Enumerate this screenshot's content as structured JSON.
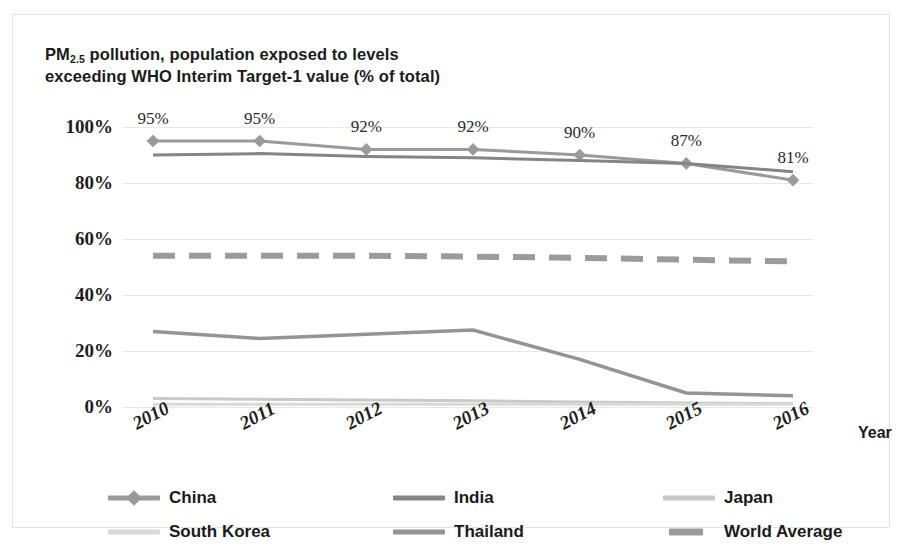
{
  "chart_data": {
    "type": "line",
    "title": "PM2.5 pollution, population exposed to levels exceeding WHO Interim Target-1 value (% of total)",
    "title_line1_pre": "PM",
    "title_line1_sub": "2.5",
    "title_line1_post": " pollution, population exposed to levels",
    "title_line2": "exceeding WHO Interim Target-1 value (% of total)",
    "xlabel": "Year",
    "ylabel": "",
    "categories": [
      "2010",
      "2011",
      "2012",
      "2013",
      "2014",
      "2015",
      "2016"
    ],
    "x": [
      2010,
      2011,
      2012,
      2013,
      2014,
      2015,
      2016
    ],
    "ylim": [
      0,
      100
    ],
    "yticks": [
      "0%",
      "20%",
      "40%",
      "60%",
      "80%",
      "100%"
    ],
    "ytick_values": [
      0,
      20,
      40,
      60,
      80,
      100
    ],
    "grid": true,
    "legend_position": "bottom",
    "data_labels": [
      "95%",
      "95%",
      "92%",
      "92%",
      "90%",
      "87%",
      "81%"
    ],
    "data_label_series": "China",
    "series": [
      {
        "name": "China",
        "color": "#9a9a9a",
        "marker": "diamond",
        "dashed": false,
        "width": 3,
        "values": [
          95,
          95,
          92,
          92,
          90,
          87,
          81
        ]
      },
      {
        "name": "India",
        "color": "#858585",
        "marker": "none",
        "dashed": false,
        "width": 3,
        "values": [
          90,
          90.5,
          89.5,
          89,
          88,
          87,
          84
        ]
      },
      {
        "name": "Japan",
        "color": "#c9c9c9",
        "marker": "none",
        "dashed": false,
        "width": 3,
        "values": [
          3,
          2.8,
          2.5,
          2.2,
          1.8,
          1.4,
          1.2
        ]
      },
      {
        "name": "South Korea",
        "color": "#d9d9d9",
        "marker": "none",
        "dashed": false,
        "width": 3,
        "values": [
          1,
          1,
          1,
          1,
          1,
          1,
          1
        ]
      },
      {
        "name": "Thailand",
        "color": "#949494",
        "marker": "none",
        "dashed": false,
        "width": 3.5,
        "values": [
          27,
          24.5,
          26,
          27.5,
          17,
          5,
          4
        ]
      },
      {
        "name": "World Average",
        "color": "#9b9b9b",
        "marker": "none",
        "dashed": true,
        "width": 6,
        "values": [
          54,
          54,
          54,
          53.7,
          53.3,
          52.6,
          52
        ]
      }
    ]
  },
  "legend": {
    "items": [
      {
        "label": "China"
      },
      {
        "label": "India"
      },
      {
        "label": "Japan"
      },
      {
        "label": "South Korea"
      },
      {
        "label": "Thailand"
      },
      {
        "label": "World Average"
      }
    ]
  }
}
